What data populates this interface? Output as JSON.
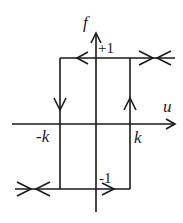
{
  "diagram": {
    "type": "hysteresis-relay",
    "axes": {
      "vertical_label": "f",
      "horizontal_label": "u"
    },
    "levels": {
      "upper_label": "+1",
      "lower_label": "-1"
    },
    "thresholds": {
      "left_label": "-k",
      "right_label": "k"
    },
    "branches": [
      {
        "name": "upper",
        "value": 1,
        "from": "-k",
        "direction": "left-and-right"
      },
      {
        "name": "lower",
        "value": -1,
        "to": "k",
        "direction": "left-and-right"
      },
      {
        "name": "left-switch",
        "at": "-k",
        "direction": "down"
      },
      {
        "name": "right-switch",
        "at": "k",
        "direction": "up"
      }
    ]
  }
}
